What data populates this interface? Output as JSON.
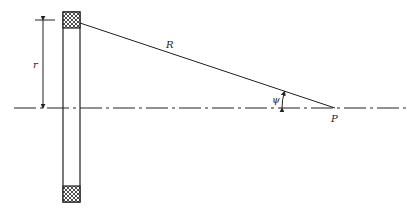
{
  "diagram": {
    "labels": {
      "radius": "r",
      "distance": "R",
      "angle": "ψ",
      "point": "P"
    },
    "colors": {
      "line": "#222222",
      "background": "#ffffff"
    },
    "geometry": {
      "axis_y": 108,
      "ring_left_x": 63,
      "ring_right_x": 80,
      "ring_top_y": 12,
      "ring_bottom_y": 202,
      "point_x": 335
    }
  }
}
